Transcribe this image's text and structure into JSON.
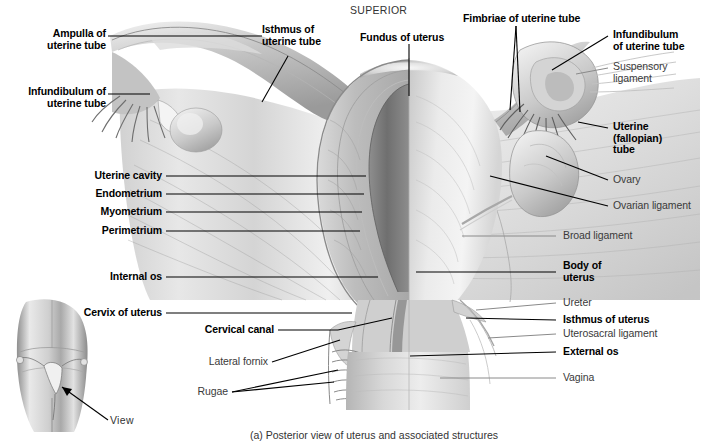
{
  "figure": {
    "orientation_label": "SUPERIOR",
    "caption": "(a) Posterior view of uterus and associated structures",
    "view_label": "View",
    "colors": {
      "label_bold": "#000000",
      "label_regular": "#3a3a3a",
      "leader_bold": "#000000",
      "leader_regular": "#8a8a8a",
      "background": "#ffffff",
      "tissue_light": "#e8e8e8",
      "tissue_mid": "#b9b9b9",
      "tissue_dark": "#7d7d7d",
      "cavity_dark": "#6e6e6e"
    }
  },
  "labels_left": [
    {
      "id": "ampulla-of-uterine-tube",
      "text": "Ampulla of\nuterine tube",
      "weight": "bold"
    },
    {
      "id": "infundibulum-of-uterine-tube-left",
      "text": "Infundibulum of\nuterine tube",
      "weight": "bold"
    },
    {
      "id": "uterine-cavity",
      "text": "Uterine cavity",
      "weight": "bold"
    },
    {
      "id": "endometrium",
      "text": "Endometrium",
      "weight": "bold"
    },
    {
      "id": "myometrium",
      "text": "Myometrium",
      "weight": "bold"
    },
    {
      "id": "perimetrium",
      "text": "Perimetrium",
      "weight": "bold"
    },
    {
      "id": "internal-os",
      "text": "Internal os",
      "weight": "bold"
    },
    {
      "id": "cervix-of-uterus",
      "text": "Cervix of uterus",
      "weight": "bold"
    },
    {
      "id": "cervical-canal",
      "text": "Cervical canal",
      "weight": "bold"
    },
    {
      "id": "lateral-fornix",
      "text": "Lateral fornix",
      "weight": "regular"
    },
    {
      "id": "rugae",
      "text": "Rugae",
      "weight": "regular"
    }
  ],
  "labels_top": [
    {
      "id": "isthmus-of-uterine-tube",
      "text": "Isthmus of\nuterine tube",
      "weight": "bold"
    },
    {
      "id": "fundus-of-uterus",
      "text": "Fundus of uterus",
      "weight": "bold"
    },
    {
      "id": "fimbriae-of-uterine-tube",
      "text": "Fimbriae of uterine tube",
      "weight": "bold"
    }
  ],
  "labels_right": [
    {
      "id": "infundibulum-of-uterine-tube-right",
      "text": "Infundibulum\nof uterine tube",
      "weight": "bold"
    },
    {
      "id": "suspensory-ligament",
      "text": "Suspensory\nligament",
      "weight": "regular"
    },
    {
      "id": "uterine-fallopian-tube",
      "text": "Uterine\n(fallopian)\ntube",
      "weight": "bold"
    },
    {
      "id": "ovary",
      "text": "Ovary",
      "weight": "regular"
    },
    {
      "id": "ovarian-ligament",
      "text": "Ovarian ligament",
      "weight": "regular"
    },
    {
      "id": "broad-ligament",
      "text": "Broad ligament",
      "weight": "regular"
    },
    {
      "id": "body-of-uterus",
      "text": "Body of\nuterus",
      "weight": "bold"
    },
    {
      "id": "ureter",
      "text": "Ureter",
      "weight": "regular"
    },
    {
      "id": "isthmus-of-uterus",
      "text": "Isthmus of uterus",
      "weight": "bold"
    },
    {
      "id": "uterosacral-ligament",
      "text": "Uterosacral ligament",
      "weight": "regular"
    },
    {
      "id": "external-os",
      "text": "External os",
      "weight": "bold"
    },
    {
      "id": "vagina",
      "text": "Vagina",
      "weight": "regular"
    }
  ]
}
